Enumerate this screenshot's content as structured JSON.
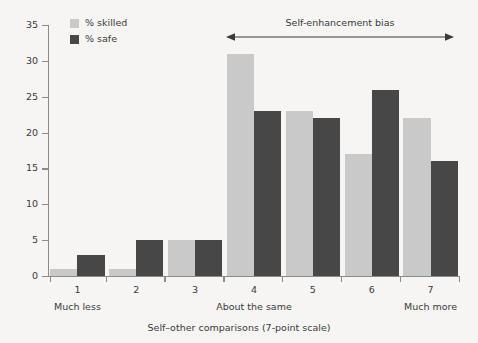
{
  "chart_data": {
    "type": "bar",
    "title": "",
    "xlabel": "Self–other comparisons (7-point scale)",
    "ylabel": "",
    "ylim": [
      0,
      35
    ],
    "ytick_step": 5,
    "yticks": [
      0,
      5,
      10,
      15,
      20,
      25,
      30,
      35
    ],
    "grid": false,
    "legend_position": "top-left",
    "categories": [
      "1",
      "2",
      "3",
      "4",
      "5",
      "6",
      "7"
    ],
    "category_endpoint_labels": {
      "left": "Much less",
      "center": "About the same",
      "right": "Much more"
    },
    "series": [
      {
        "name": "% skilled",
        "color": "#c9c9c9",
        "values": [
          1,
          1,
          5,
          31,
          23,
          17,
          22
        ]
      },
      {
        "name": "% safe",
        "color": "#474747",
        "values": [
          3,
          5,
          5,
          23,
          22,
          26,
          16
        ]
      }
    ],
    "annotations": [
      {
        "text": "Self-enhancement bias",
        "type": "double-headed-arrow",
        "spans_categories": [
          "4",
          "7"
        ]
      }
    ]
  },
  "legend": {
    "items": [
      {
        "label": "% skilled",
        "color": "#c9c9c9"
      },
      {
        "label": "% safe",
        "color": "#474747"
      }
    ]
  },
  "axes": {
    "x_title": "Self–other comparisons (7-point scale)",
    "y_tick_labels": [
      "0",
      "5",
      "10",
      "15",
      "20",
      "25",
      "30",
      "35"
    ],
    "x_tick_labels": [
      "1",
      "2",
      "3",
      "4",
      "5",
      "6",
      "7"
    ],
    "x_endpoint_labels": [
      "Much less",
      "About the same",
      "Much more"
    ]
  },
  "annotation": {
    "label": "Self-enhancement bias"
  },
  "colors": {
    "background": "#f6f5f3",
    "axis": "#8b8b8b",
    "text": "#3a3a3a",
    "skilled": "#c9c9c9",
    "safe": "#474747"
  }
}
